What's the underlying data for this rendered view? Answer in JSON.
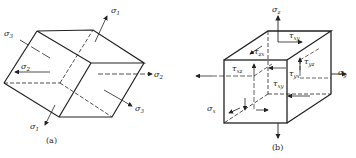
{
  "figure_a": {
    "caption": "(a)",
    "labels": {
      "s1_top": "σ",
      "s1_top_sub": "1",
      "s3_left": "σ",
      "s3_left_sub": "3",
      "s2_left": "σ",
      "s2_left_sub": "2",
      "s2_right": "σ",
      "s2_right_sub": "2",
      "s3_right": "σ",
      "s3_right_sub": "3",
      "s1_bottom": "σ",
      "s1_bottom_sub": "1"
    }
  },
  "figure_b": {
    "caption": "(b)",
    "labels": {
      "sz": "σ",
      "sz_sub": "z",
      "txy_top": "τ",
      "txy_top_sub": "xy",
      "tzx": "τ",
      "tzx_sub": "zx",
      "txz": "τ",
      "txz_sub": "xz",
      "tyz": "τ",
      "tyz_sub": "yz",
      "tyx": "τ",
      "tyx_sub": "yx",
      "txy_front": "τ",
      "txy_front_sub": "xy",
      "sy": "σ",
      "sy_sub": "y",
      "sx": "σ",
      "sx_sub": "x"
    }
  }
}
